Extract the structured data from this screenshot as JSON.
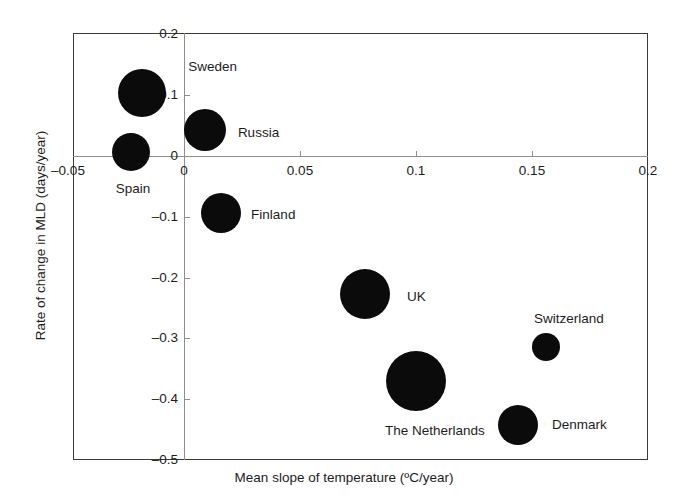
{
  "chart_data": {
    "type": "scatter",
    "title": "",
    "xlabel": "Mean slope of temperature (ºC/year)",
    "ylabel": "Rate of change in MLD (days/year)",
    "xlim": [
      -0.0475,
      0.2
    ],
    "ylim": [
      -0.5,
      0.2
    ],
    "grid": false,
    "legend": "none",
    "bubble_encoding": "marker area encodes an unlabeled magnitude",
    "xticks": [
      {
        "value": -0.05,
        "label": "–0.05"
      },
      {
        "value": 0,
        "label": "0"
      },
      {
        "value": 0.05,
        "label": "0.05"
      },
      {
        "value": 0.1,
        "label": "0.1"
      },
      {
        "value": 0.15,
        "label": "0.15"
      },
      {
        "value": 0.2,
        "label": "0.2"
      }
    ],
    "yticks": [
      {
        "value": 0.2,
        "label": "0.2"
      },
      {
        "value": 0.1,
        "label": "0.1"
      },
      {
        "value": 0,
        "label": "0"
      },
      {
        "value": -0.1,
        "label": "–0.1"
      },
      {
        "value": -0.2,
        "label": "–0.2"
      },
      {
        "value": -0.3,
        "label": "–0.3"
      },
      {
        "value": -0.4,
        "label": "–0.4"
      },
      {
        "value": -0.5,
        "label": "–0.5"
      }
    ],
    "points": [
      {
        "name": "Sweden",
        "x": -0.018,
        "y": 0.103,
        "r_px": 24,
        "label_dx": 40,
        "label_dy": -26
      },
      {
        "name": "Russia",
        "x": 0.009,
        "y": 0.043,
        "r_px": 21,
        "label_dx": 30,
        "label_dy": 3
      },
      {
        "name": "Spain",
        "x": -0.023,
        "y": 0.007,
        "r_px": 19,
        "label_dx": -16,
        "label_dy": 37
      },
      {
        "name": "Finland",
        "x": 0.016,
        "y": -0.094,
        "r_px": 20,
        "label_dx": 28,
        "label_dy": 2
      },
      {
        "name": "UK",
        "x": 0.078,
        "y": -0.227,
        "r_px": 25,
        "label_dx": 35,
        "label_dy": 3
      },
      {
        "name": "The Netherlands",
        "x": 0.1,
        "y": -0.37,
        "r_px": 30,
        "label_dx": -43,
        "label_dy": 50
      },
      {
        "name": "Switzerland",
        "x": 0.156,
        "y": -0.314,
        "r_px": 14,
        "label_dx": -8,
        "label_dy": -28
      },
      {
        "name": "Denmark",
        "x": 0.144,
        "y": -0.442,
        "r_px": 20,
        "label_dx": 32,
        "label_dy": 0
      }
    ]
  },
  "axes": {
    "x_title": "Mean slope of temperature (ºC/year)",
    "y_title": "Rate of change in MLD (days/year)"
  },
  "colors": {
    "marker": "#0b0b0b",
    "frame": "#3a3a3a",
    "zero_axis": "#8e8e8e",
    "text": "#1c1c1c",
    "background": "#ffffff"
  }
}
